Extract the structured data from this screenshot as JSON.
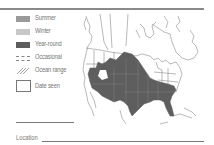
{
  "legend": {
    "items": [
      {
        "key": "summer",
        "label": "Summer",
        "color": "#9a9a9a"
      },
      {
        "key": "winter",
        "label": "Winter",
        "color": "#c8c8c8"
      },
      {
        "key": "year_round",
        "label": "Year-round",
        "color": "#5e5e5e"
      },
      {
        "key": "occasional",
        "label": "Occasional",
        "pattern": "dashed"
      },
      {
        "key": "ocean_range",
        "label": "Ocean range",
        "pattern": "hatched"
      },
      {
        "key": "date_seen",
        "label": "Date seen",
        "pattern": "checkbox"
      }
    ]
  },
  "form": {
    "location_label": "Location"
  },
  "map": {
    "region": "North America",
    "range_type_shown": "Year-round",
    "range_color": "#5e5e5e",
    "border_color": "#8a8a8a"
  }
}
